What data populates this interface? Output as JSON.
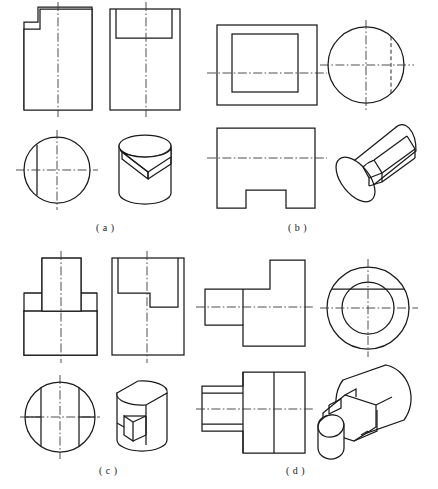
{
  "document": {
    "type": "engineering-drawing-worksheet",
    "title": "Orthographic projections and isometric pictorials",
    "panel_count": 4,
    "line_color": "#1a1a1a",
    "background": "#ffffff",
    "page_width": 438,
    "page_height": 489
  },
  "panels": [
    {
      "id": "a",
      "caption": "( a )",
      "views": [
        {
          "name": "front-view",
          "shape": "rectangle-with-upper-left-notch",
          "has_vertical_centerline": true
        },
        {
          "name": "side-view",
          "shape": "rectangle-with-top-rectangular-recess",
          "has_vertical_centerline": true
        },
        {
          "name": "top-view",
          "shape": "circle-with-left-vertical-chord",
          "has_vertical_centerline": true,
          "has_horizontal_centerline": true
        },
        {
          "name": "isometric-view",
          "shape": "cylinder-with-angled-slot-cut"
        }
      ]
    },
    {
      "id": "b",
      "caption": "( b )",
      "views": [
        {
          "name": "top-view",
          "shape": "rectangle-with-inner-rectangle",
          "has_horizontal_centerline": true
        },
        {
          "name": "side-view",
          "shape": "circle-with-right-hidden-line",
          "has_vertical_centerline": true,
          "has_horizontal_centerline": true
        },
        {
          "name": "front-view",
          "shape": "rectangle-with-bottom-center-notch",
          "has_horizontal_centerline": true
        },
        {
          "name": "isometric-view",
          "shape": "horizontal-cylinder-with-rectangular-slot"
        }
      ]
    },
    {
      "id": "c",
      "caption": "( c )",
      "views": [
        {
          "name": "front-view",
          "shape": "tee-stepped-profile",
          "has_vertical_centerline": true
        },
        {
          "name": "side-view",
          "shape": "rectangle-with-upper-left-step-cut",
          "has_vertical_centerline": true
        },
        {
          "name": "top-view",
          "shape": "circle-with-two-vertical-chords-and-slot",
          "has_vertical_centerline": true,
          "has_horizontal_centerline": true
        },
        {
          "name": "isometric-view",
          "shape": "flatted-cylinder-with-notch"
        }
      ]
    },
    {
      "id": "d",
      "caption": "( d )",
      "views": [
        {
          "name": "front-view",
          "shape": "stepped-boss-with-upper-tab",
          "has_horizontal_centerline": true
        },
        {
          "name": "side-view",
          "shape": "concentric-circles-with-top-chord",
          "has_vertical_centerline": true,
          "has_horizontal_centerline": true
        },
        {
          "name": "top-view",
          "shape": "stepped-boss-with-hidden-detail",
          "has_horizontal_centerline": true
        },
        {
          "name": "isometric-view",
          "shape": "cylindrical-body-with-square-shaft-and-keyway"
        }
      ]
    }
  ]
}
